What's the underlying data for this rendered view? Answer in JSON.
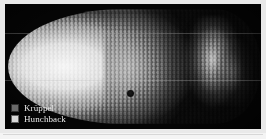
{
  "figure": {
    "kind": "fluorescence-micrograph",
    "background_color": "#050505",
    "frame_color": "#e9e9e9"
  },
  "legend": {
    "position": "bottom-left",
    "items": [
      {
        "label": "Krüppel",
        "swatch_color": "#6a6a6a",
        "swatch_name": "kruppel-swatch"
      },
      {
        "label": "Hunchback",
        "swatch_color": "#d8d8d8",
        "swatch_name": "hunchback-swatch"
      }
    ]
  },
  "micrograph": {
    "domains": [
      {
        "name": "hunchback-anterior-domain",
        "description": "broad bright anterior expression domain",
        "intensity": "high"
      },
      {
        "name": "kruppel-central-band",
        "description": "central grey band of expression",
        "intensity": "medium"
      },
      {
        "name": "posterior-stripe",
        "description": "posterior expression stripe",
        "intensity": "medium"
      },
      {
        "name": "posterior-tail",
        "description": "faint posterior-most signal",
        "intensity": "low"
      }
    ],
    "artifacts": [
      {
        "name": "scanline-upper",
        "type": "horizontal-scan-line"
      },
      {
        "name": "scanline-lower",
        "type": "horizontal-scan-line"
      },
      {
        "name": "dark-blemish",
        "type": "dark-spot"
      }
    ]
  }
}
